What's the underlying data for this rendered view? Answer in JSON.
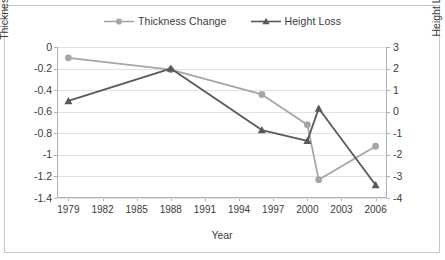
{
  "chart_data": {
    "type": "line",
    "title": "",
    "xlabel": "Year",
    "ylabel": "Thickness Change [m / year]",
    "y2label": "Height Loss [m]",
    "grid": true,
    "legend_position": "top-center",
    "xlim": [
      1978,
      2007
    ],
    "xticks": [
      "1979",
      "1982",
      "1985",
      "1988",
      "1991",
      "1994",
      "1997",
      "2000",
      "2003",
      "2006"
    ],
    "xtick_values": [
      1979,
      1982,
      1985,
      1988,
      1991,
      1994,
      1997,
      2000,
      2003,
      2006
    ],
    "ylim": [
      0,
      -1.4
    ],
    "yticks": [
      "0",
      "-0.2",
      "-0.4",
      "-0.6",
      "-0.8",
      "-1",
      "-1.2",
      "-1.4"
    ],
    "ytick_values": [
      0,
      -0.2,
      -0.4,
      -0.6,
      -0.8,
      -1,
      -1.2,
      -1.4
    ],
    "y2lim": [
      3,
      -4
    ],
    "y2ticks": [
      "3",
      "2",
      "1",
      "0",
      "-1",
      "-2",
      "-3",
      "-4"
    ],
    "y2tick_values": [
      3,
      2,
      1,
      0,
      -1,
      -2,
      -3,
      -4
    ],
    "series": [
      {
        "name": "Thickness Change",
        "axis": "left",
        "color": "#a6a6a6",
        "marker": "circle",
        "x": [
          1979,
          1988,
          1996,
          2000,
          2001,
          2006
        ],
        "values": [
          -0.1,
          -0.21,
          -0.44,
          -0.72,
          -1.23,
          -0.92
        ]
      },
      {
        "name": "Height Loss",
        "axis": "right",
        "color": "#595959",
        "marker": "triangle",
        "x": [
          1979,
          1988,
          1996,
          2000,
          2001,
          2006
        ],
        "values": [
          0.5,
          2.0,
          -0.85,
          -1.35,
          0.15,
          -3.4
        ]
      }
    ]
  },
  "legend": {
    "items": [
      {
        "label": "Thickness Change",
        "color": "#a6a6a6",
        "marker": "circle"
      },
      {
        "label": "Height Loss",
        "color": "#595959",
        "marker": "triangle"
      }
    ]
  },
  "colors": {
    "thickness_change": "#a6a6a6",
    "height_loss": "#595959",
    "gridline": "#e2e2e2",
    "axis": "#b0b0b0",
    "border": "#c8c8c8",
    "text": "#3a3a3a",
    "background": "#ffffff"
  }
}
